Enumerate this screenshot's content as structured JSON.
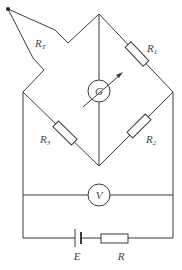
{
  "diagram": {
    "colors": {
      "line": "#3a3a3a",
      "label": "#444444",
      "background": "#ffffff"
    },
    "components": {
      "thermistor": {
        "symbol": "R",
        "subscript": "T"
      },
      "r1": {
        "symbol": "R",
        "subscript": "1"
      },
      "r2": {
        "symbol": "R",
        "subscript": "2"
      },
      "r3": {
        "symbol": "R",
        "subscript": "3"
      },
      "galvanometer": {
        "symbol": "G"
      },
      "voltmeter": {
        "symbol": "V"
      },
      "battery": {
        "symbol": "E"
      },
      "resistor": {
        "symbol": "R"
      }
    }
  }
}
